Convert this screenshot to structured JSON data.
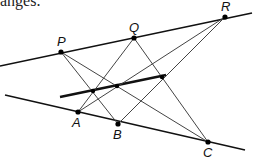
{
  "caption": "anges.",
  "diagram": {
    "points": {
      "P": {
        "label": "P",
        "x": 61,
        "y": 52
      },
      "Q": {
        "label": "Q",
        "x": 134,
        "y": 38
      },
      "R": {
        "label": "R",
        "x": 225,
        "y": 17
      },
      "A": {
        "label": "A",
        "x": 78,
        "y": 112
      },
      "B": {
        "label": "B",
        "x": 118,
        "y": 124
      },
      "C": {
        "label": "C",
        "x": 208,
        "y": 142
      }
    },
    "lines": {
      "top_line": {
        "x1": 0,
        "y1": 66,
        "x2": 252,
        "y2": 13
      },
      "bottom_line": {
        "x1": 5,
        "y1": 95,
        "x2": 245,
        "y2": 150
      },
      "pappus_line": {
        "x1": 60,
        "y1": 97,
        "x2": 166,
        "y2": 75
      }
    },
    "cross_segments": [
      [
        "P",
        "B"
      ],
      [
        "P",
        "C"
      ],
      [
        "Q",
        "A"
      ],
      [
        "Q",
        "C"
      ],
      [
        "R",
        "A"
      ],
      [
        "R",
        "B"
      ]
    ],
    "intersection_points": [
      {
        "x": 93,
        "y": 91
      },
      {
        "x": 117,
        "y": 86
      },
      {
        "x": 162,
        "y": 77
      }
    ],
    "colors": {
      "line": "#111111",
      "thin_line": "#444444",
      "point": "#000000"
    }
  }
}
